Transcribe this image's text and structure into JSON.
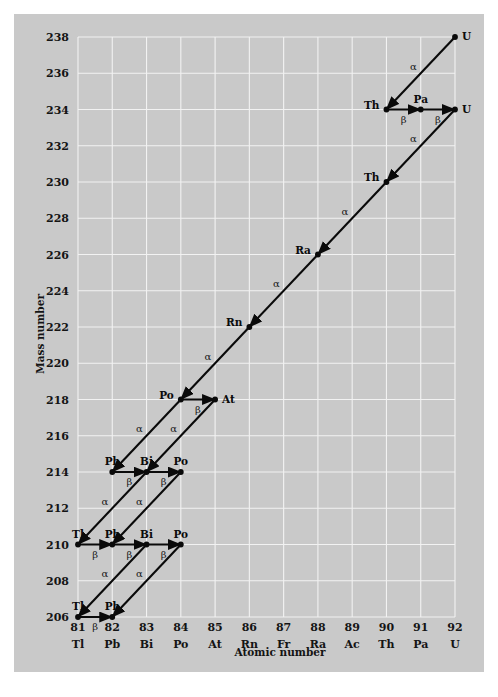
{
  "chart_data": {
    "type": "scatter",
    "title": "",
    "xlabel": "Atomic number",
    "ylabel": "Mass number",
    "xlim": [
      81,
      92
    ],
    "ylim": [
      206,
      238
    ],
    "grid": true,
    "legend": null,
    "x_ticks": [
      81,
      82,
      83,
      84,
      85,
      86,
      87,
      88,
      89,
      90,
      91,
      92
    ],
    "x_tick_labels": [
      "81",
      "82",
      "83",
      "84",
      "85",
      "86",
      "87",
      "88",
      "89",
      "90",
      "91",
      "92"
    ],
    "x_symbols": [
      "Tl",
      "Pb",
      "Bi",
      "Po",
      "At",
      "Rn",
      "Fr",
      "Ra",
      "Ac",
      "Th",
      "Pa",
      "U"
    ],
    "y_ticks": [
      206,
      208,
      210,
      212,
      214,
      216,
      218,
      220,
      222,
      224,
      226,
      228,
      230,
      232,
      234,
      236,
      238
    ],
    "y_tick_labels": [
      "206",
      "208",
      "210",
      "212",
      "214",
      "216",
      "218",
      "220",
      "222",
      "224",
      "226",
      "228",
      "230",
      "232",
      "234",
      "236",
      "238"
    ],
    "nodes": [
      {
        "symbol": "U",
        "z": 92,
        "a": 238,
        "label_pos": "right"
      },
      {
        "symbol": "Th",
        "z": 90,
        "a": 234,
        "label_pos": "left"
      },
      {
        "symbol": "Pa",
        "z": 91,
        "a": 234,
        "label_pos": "above"
      },
      {
        "symbol": "U",
        "z": 92,
        "a": 234,
        "label_pos": "right"
      },
      {
        "symbol": "Th",
        "z": 90,
        "a": 230,
        "label_pos": "left"
      },
      {
        "symbol": "Ra",
        "z": 88,
        "a": 226,
        "label_pos": "left"
      },
      {
        "symbol": "Rn",
        "z": 86,
        "a": 222,
        "label_pos": "left"
      },
      {
        "symbol": "Po",
        "z": 84,
        "a": 218,
        "label_pos": "left"
      },
      {
        "symbol": "At",
        "z": 85,
        "a": 218,
        "label_pos": "right"
      },
      {
        "symbol": "Pb",
        "z": 82,
        "a": 214,
        "label_pos": "above"
      },
      {
        "symbol": "Bi",
        "z": 83,
        "a": 214,
        "label_pos": "above"
      },
      {
        "symbol": "Po",
        "z": 84,
        "a": 214,
        "label_pos": "above"
      },
      {
        "symbol": "Tl",
        "z": 81,
        "a": 210,
        "label_pos": "above"
      },
      {
        "symbol": "Pb",
        "z": 82,
        "a": 210,
        "label_pos": "above"
      },
      {
        "symbol": "Bi",
        "z": 83,
        "a": 210,
        "label_pos": "above"
      },
      {
        "symbol": "Po",
        "z": 84,
        "a": 210,
        "label_pos": "above"
      },
      {
        "symbol": "Tl",
        "z": 81,
        "a": 206,
        "label_pos": "above"
      },
      {
        "symbol": "Pb",
        "z": 82,
        "a": 206,
        "label_pos": "above"
      }
    ],
    "decays": [
      {
        "from_z": 92,
        "from_a": 238,
        "to_z": 90,
        "to_a": 234,
        "type": "alpha",
        "label": "α",
        "label_side": "above"
      },
      {
        "from_z": 90,
        "from_a": 234,
        "to_z": 91,
        "to_a": 234,
        "type": "beta",
        "label": "β",
        "label_side": "below"
      },
      {
        "from_z": 91,
        "from_a": 234,
        "to_z": 92,
        "to_a": 234,
        "type": "beta",
        "label": "β",
        "label_side": "below"
      },
      {
        "from_z": 92,
        "from_a": 234,
        "to_z": 90,
        "to_a": 230,
        "type": "alpha",
        "label": "α",
        "label_side": "above"
      },
      {
        "from_z": 90,
        "from_a": 230,
        "to_z": 88,
        "to_a": 226,
        "type": "alpha",
        "label": "α",
        "label_side": "above"
      },
      {
        "from_z": 88,
        "from_a": 226,
        "to_z": 86,
        "to_a": 222,
        "type": "alpha",
        "label": "α",
        "label_side": "above"
      },
      {
        "from_z": 86,
        "from_a": 222,
        "to_z": 84,
        "to_a": 218,
        "type": "alpha",
        "label": "α",
        "label_side": "above"
      },
      {
        "from_z": 84,
        "from_a": 218,
        "to_z": 85,
        "to_a": 218,
        "type": "beta",
        "label": "β",
        "label_side": "below"
      },
      {
        "from_z": 84,
        "from_a": 218,
        "to_z": 82,
        "to_a": 214,
        "type": "alpha",
        "label": "α",
        "label_side": "above"
      },
      {
        "from_z": 85,
        "from_a": 218,
        "to_z": 83,
        "to_a": 214,
        "type": "alpha",
        "label": "α",
        "label_side": "above"
      },
      {
        "from_z": 82,
        "from_a": 214,
        "to_z": 83,
        "to_a": 214,
        "type": "beta",
        "label": "β",
        "label_side": "below"
      },
      {
        "from_z": 83,
        "from_a": 214,
        "to_z": 84,
        "to_a": 214,
        "type": "beta",
        "label": "β",
        "label_side": "below"
      },
      {
        "from_z": 83,
        "from_a": 214,
        "to_z": 81,
        "to_a": 210,
        "type": "alpha",
        "label": "α",
        "label_side": "above"
      },
      {
        "from_z": 84,
        "from_a": 214,
        "to_z": 82,
        "to_a": 210,
        "type": "alpha",
        "label": "α",
        "label_side": "above"
      },
      {
        "from_z": 81,
        "from_a": 210,
        "to_z": 82,
        "to_a": 210,
        "type": "beta",
        "label": "β",
        "label_side": "below"
      },
      {
        "from_z": 82,
        "from_a": 210,
        "to_z": 83,
        "to_a": 210,
        "type": "beta",
        "label": "β",
        "label_side": "below"
      },
      {
        "from_z": 83,
        "from_a": 210,
        "to_z": 84,
        "to_a": 210,
        "type": "beta",
        "label": "β",
        "label_side": "below"
      },
      {
        "from_z": 83,
        "from_a": 210,
        "to_z": 81,
        "to_a": 206,
        "type": "alpha",
        "label": "α",
        "label_side": "above"
      },
      {
        "from_z": 84,
        "from_a": 210,
        "to_z": 82,
        "to_a": 206,
        "type": "alpha",
        "label": "α",
        "label_side": "above"
      },
      {
        "from_z": 81,
        "from_a": 206,
        "to_z": 82,
        "to_a": 206,
        "type": "beta",
        "label": "β",
        "label_side": "below"
      }
    ],
    "colors": {
      "figure_background": "#c9c9c9",
      "page_background": "#ffffff",
      "gridline": "#f2f2f2",
      "arrow": "#0a0a0a",
      "text": "#141414"
    }
  }
}
